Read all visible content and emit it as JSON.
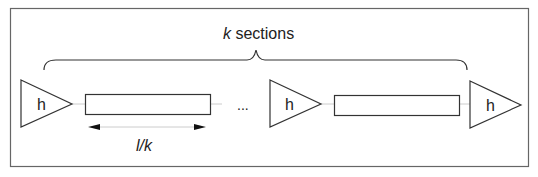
{
  "diagram": {
    "title_var": "k",
    "title_rest": " sections",
    "repeater_label": "h",
    "ellipsis": "...",
    "length_label": "l/k",
    "colors": {
      "stroke": "#333333",
      "wire": "#cccccc",
      "frame": "#666666",
      "background": "#ffffff"
    },
    "nodes": [
      {
        "type": "repeater",
        "label": "h"
      },
      {
        "type": "wire-section"
      },
      {
        "type": "ellipsis",
        "label": "..."
      },
      {
        "type": "repeater",
        "label": "h"
      },
      {
        "type": "wire-section"
      },
      {
        "type": "repeater",
        "label": "h"
      }
    ]
  }
}
